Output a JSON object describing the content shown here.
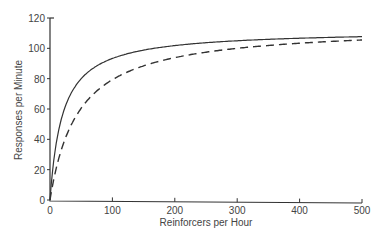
{
  "chart_data": {
    "type": "line",
    "title": "",
    "xlabel": "Reinforcers per Hour",
    "ylabel": "Responses per Minute",
    "xlim": [
      0,
      500
    ],
    "ylim": [
      0,
      120
    ],
    "x_ticks": [
      0,
      100,
      200,
      300,
      400,
      500
    ],
    "y_ticks": [
      0,
      20,
      40,
      60,
      80,
      100,
      120
    ],
    "grid": false,
    "legend": null,
    "series": [
      {
        "name": "solid",
        "style": "solid",
        "x": [
          0,
          5,
          10,
          20,
          30,
          50,
          75,
          100,
          150,
          200,
          250,
          300,
          350,
          400,
          450,
          500
        ],
        "values": [
          0,
          22,
          37,
          56,
          67,
          80,
          88,
          93,
          99,
          102,
          104,
          105,
          106,
          107,
          107,
          108
        ]
      },
      {
        "name": "dashed",
        "style": "dashed",
        "x": [
          0,
          5,
          10,
          20,
          30,
          50,
          75,
          100,
          150,
          200,
          250,
          300,
          350,
          400,
          450,
          500
        ],
        "values": [
          0,
          12,
          21,
          35,
          46,
          61,
          72,
          79,
          88,
          94,
          97,
          100,
          102,
          103,
          104,
          105
        ]
      }
    ]
  }
}
